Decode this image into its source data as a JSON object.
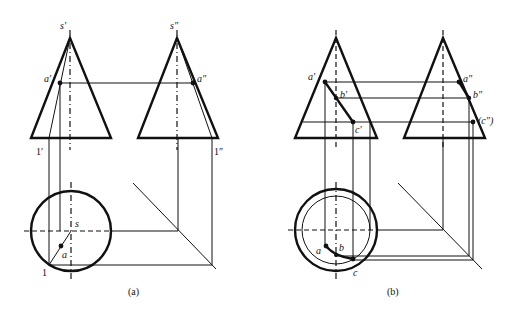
{
  "figure_a": {
    "caption": "(a)",
    "labels": {
      "s_front": "s′",
      "s_side": "s″",
      "a_front": "a′",
      "a_side": "a″",
      "one_front": "1′",
      "one_side": "1″",
      "s_top": "s",
      "a_top": "a",
      "one_top": "1"
    }
  },
  "figure_b": {
    "caption": "(b)",
    "labels": {
      "a_front": "a′",
      "b_front": "b′",
      "c_front": "c′",
      "a_side": "a″",
      "b_side": "b″",
      "c_side": "(c″)",
      "a_top": "a",
      "b_top": "b",
      "c_top": "c"
    }
  }
}
